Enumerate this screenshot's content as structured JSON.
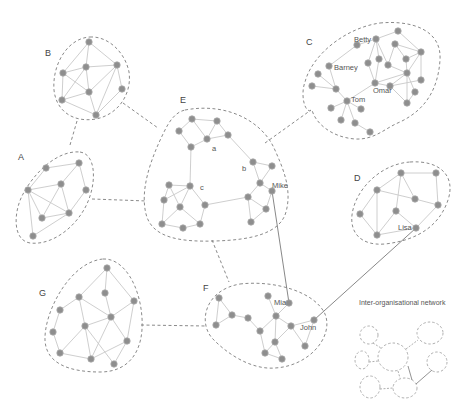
{
  "diagram": {
    "title": "Inter-organisational network",
    "colors": {
      "node": "#8e8e8e",
      "edge": "#c8c8c8",
      "boundary": "#8a8a8a",
      "inter_link": "#7a7a7a"
    },
    "clusters": [
      {
        "id": "A",
        "label": "A",
        "label_pos": [
          18,
          157
        ]
      },
      {
        "id": "B",
        "label": "B",
        "label_pos": [
          45,
          53
        ]
      },
      {
        "id": "C",
        "label": "C",
        "label_pos": [
          306,
          42
        ]
      },
      {
        "id": "D",
        "label": "D",
        "label_pos": [
          354,
          178
        ]
      },
      {
        "id": "E",
        "label": "E",
        "label_pos": [
          180,
          100
        ]
      },
      {
        "id": "F",
        "label": "F",
        "label_pos": [
          203,
          288
        ]
      },
      {
        "id": "G",
        "label": "G",
        "label_pos": [
          39,
          293
        ]
      }
    ],
    "people": [
      {
        "name": "Betty",
        "cluster": "C"
      },
      {
        "name": "Barney",
        "cluster": "C"
      },
      {
        "name": "Omar",
        "cluster": "C"
      },
      {
        "name": "Tom",
        "cluster": "C"
      },
      {
        "name": "a",
        "cluster": "E"
      },
      {
        "name": "b",
        "cluster": "E"
      },
      {
        "name": "c",
        "cluster": "E"
      },
      {
        "name": "Mike",
        "cluster": "E"
      },
      {
        "name": "Lisa",
        "cluster": "D"
      },
      {
        "name": "Mia",
        "cluster": "F"
      },
      {
        "name": "John",
        "cluster": "F"
      }
    ],
    "inter_cluster_links": [
      {
        "from": "B",
        "to": "E",
        "type": "dashed"
      },
      {
        "from": "B",
        "to": "A",
        "type": "dashed"
      },
      {
        "from": "A",
        "to": "E",
        "type": "dashed"
      },
      {
        "from": "E",
        "to": "C",
        "type": "dashed"
      },
      {
        "from": "E",
        "to": "F",
        "type": "dashed"
      },
      {
        "from": "G",
        "to": "F",
        "type": "dashed"
      },
      {
        "from": "Mike",
        "to": "Mia",
        "type": "personal"
      },
      {
        "from": "Lisa",
        "to": "John",
        "type": "personal"
      }
    ]
  }
}
